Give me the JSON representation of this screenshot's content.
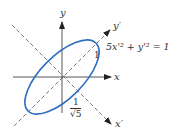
{
  "figure": {
    "type": "rotated-ellipse-diagram",
    "equation": "5x'² + y'² = 1",
    "axes": {
      "x_label": "x",
      "y_label": "y",
      "x_prime_label": "x′",
      "y_prime_label": "y′"
    },
    "annotations": {
      "semi_major": "1",
      "semi_minor_numerator": "1",
      "semi_minor_denominator_radical": "√",
      "semi_minor_denominator_value": "5"
    },
    "colors": {
      "ellipse": "#2f6fc0",
      "axes": "#333333",
      "rotated_axes": "#555555"
    },
    "rotation_degrees": 45
  }
}
